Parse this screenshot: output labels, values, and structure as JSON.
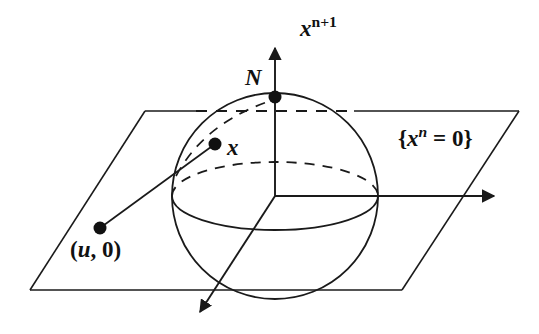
{
  "figure": {
    "kind": "stereographic-projection-diagram",
    "background_color": "#ffffff",
    "stroke_color": "#1a1a1a",
    "labels": {
      "vertical_axis": {
        "base": "x",
        "superscript": "n+1",
        "full": "x^{n+1}"
      },
      "north_pole": {
        "full": "N"
      },
      "sphere_point": {
        "full": "x"
      },
      "plane_set": {
        "prefix": "{",
        "base": "x",
        "superscript": "n",
        "relation": " = 0",
        "suffix": "}",
        "full": "{x^n = 0}"
      },
      "plane_point": {
        "full": "(u, 0)",
        "open": "(",
        "u": "u",
        "comma": ", ",
        "zero": "0",
        "close": ")"
      }
    },
    "geometry": {
      "sphere": {
        "cx": 275,
        "cy": 196,
        "r": 103
      },
      "origin": {
        "x": 275,
        "y": 196
      },
      "north_pole_point": {
        "x": 275,
        "y": 97
      },
      "sphere_point_x": {
        "x": 215,
        "y": 144
      },
      "plane_point_u0": {
        "x": 100,
        "y": 228
      },
      "plane_corners": [
        {
          "x": 145,
          "y": 111
        },
        {
          "x": 519,
          "y": 111
        },
        {
          "x": 402,
          "y": 290
        },
        {
          "x": 30,
          "y": 290
        }
      ],
      "vertical_axis_tip": {
        "x": 275,
        "y": 45
      },
      "horizontal_axis_tip": {
        "x": 497,
        "y": 196
      },
      "diagonal_axis_tip": {
        "x": 197,
        "y": 315
      }
    }
  }
}
